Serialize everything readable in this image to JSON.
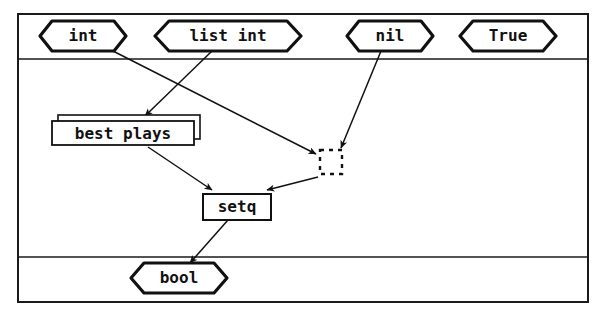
{
  "diagram": {
    "frame": {
      "x": 17,
      "y": 13,
      "width": 572,
      "height": 290,
      "stroke": "#1a1a1a",
      "stroke_width": 2
    },
    "dividers": [
      {
        "name": "top-band-divider",
        "y": 59
      },
      {
        "name": "bottom-band-divider",
        "y": 257
      }
    ],
    "colors": {
      "stroke": "#111111",
      "background": "#ffffff",
      "text": "#111111"
    },
    "bands": [
      {
        "name": "inputs-band",
        "label": ""
      },
      {
        "name": "body-band",
        "label": ""
      },
      {
        "name": "output-band",
        "label": ""
      }
    ],
    "nodes": [
      {
        "id": "int",
        "label": "int",
        "shape": "hexagon",
        "x": 40,
        "y": 21,
        "width": 86,
        "height": 30
      },
      {
        "id": "list-int",
        "label": "list int",
        "shape": "hexagon",
        "x": 155,
        "y": 21,
        "width": 146,
        "height": 30
      },
      {
        "id": "nil",
        "label": "nil",
        "shape": "hexagon",
        "x": 347,
        "y": 21,
        "width": 86,
        "height": 30
      },
      {
        "id": "true",
        "label": "True",
        "shape": "hexagon",
        "x": 460,
        "y": 21,
        "width": 96,
        "height": 30
      },
      {
        "id": "best-plays",
        "label": "best plays",
        "shape": "stacked-rect",
        "x": 52,
        "y": 119,
        "width": 142,
        "height": 24
      },
      {
        "id": "cons-cell",
        "label": "",
        "shape": "dashed-rect",
        "x": 320,
        "y": 149,
        "width": 22,
        "height": 24
      },
      {
        "id": "setq",
        "label": "setq",
        "shape": "rect",
        "x": 203,
        "y": 193,
        "width": 68,
        "height": 26
      },
      {
        "id": "bool",
        "label": "bool",
        "shape": "hexagon",
        "x": 131,
        "y": 263,
        "width": 96,
        "height": 30
      }
    ],
    "edges": [
      {
        "id": "e1",
        "from": "int",
        "to": "cons-cell",
        "x1": 111,
        "y1": 50,
        "x2": 318,
        "y2": 155
      },
      {
        "id": "e2",
        "from": "list-int",
        "to": "best-plays",
        "x1": 212,
        "y1": 51,
        "x2": 143,
        "y2": 117
      },
      {
        "id": "e3",
        "from": "nil",
        "to": "cons-cell",
        "x1": 381,
        "y1": 51,
        "x2": 340,
        "y2": 148
      },
      {
        "id": "e4",
        "from": "best-plays",
        "to": "setq",
        "x1": 148,
        "y1": 147,
        "x2": 213,
        "y2": 190
      },
      {
        "id": "e5",
        "from": "cons-cell",
        "to": "setq",
        "x1": 318,
        "y1": 178,
        "x2": 268,
        "y2": 190
      },
      {
        "id": "e6",
        "from": "setq",
        "to": "bool",
        "x1": 228,
        "y1": 220,
        "x2": 190,
        "y2": 264
      }
    ]
  }
}
